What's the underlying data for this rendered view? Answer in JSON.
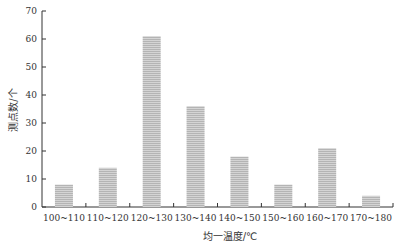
{
  "chart_data": {
    "type": "bar",
    "title": "",
    "xlabel": "均一温度/℃",
    "ylabel": "测点数/个",
    "categories": [
      "100~110",
      "110~120",
      "120~130",
      "130~140",
      "140~150",
      "150~160",
      "160~170",
      "170~180"
    ],
    "values": [
      8,
      14,
      61,
      36,
      18,
      8,
      21,
      4
    ],
    "ylim": [
      0,
      70
    ],
    "yticks": [
      0,
      10,
      20,
      30,
      40,
      50,
      60,
      70
    ],
    "grid": false,
    "legend": null,
    "bar_color": "#c8c8c8",
    "bar_fill": "hatched-horizontal"
  }
}
